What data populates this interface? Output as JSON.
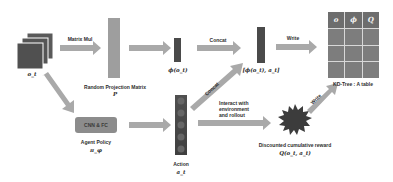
{
  "diagram": {
    "observation": {
      "label": "o_t",
      "icon": "stacked-frames-icon"
    },
    "matrix_mul": {
      "label": "Matrix Mul"
    },
    "projection": {
      "title": "Random Projection Matrix",
      "symbol": "P"
    },
    "embedding": {
      "label": "ϕ(o_t)"
    },
    "concat_top": {
      "label": "Concat"
    },
    "concat_diag": {
      "label": "Concat"
    },
    "key_vector": {
      "label": "[ϕ(o_t), a_t]"
    },
    "write_top": {
      "label": "Write"
    },
    "write_diag": {
      "label": "Write"
    },
    "kd_table": {
      "caption": "KD-Tree : A table",
      "headers": [
        "o",
        "ϕ",
        "Q"
      ],
      "rows": 3
    },
    "policy": {
      "box_label": "CNN & FC",
      "title": "Agent Policy",
      "symbol": "π_φ"
    },
    "action": {
      "title": "Action",
      "symbol": "a_t"
    },
    "interact": {
      "line1": "Interact with",
      "line2": "environment",
      "line3": "and rollout"
    },
    "reward": {
      "title": "Discounted cumulative reward",
      "symbol": "Q(o_t, a_t)"
    },
    "colors": {
      "arrow": "#a9a9a9",
      "dark_bar": "#4a4a4a",
      "light_bar": "#9e9e9e",
      "table_cell": "#7d7d7d",
      "box": "#8c8c8c",
      "starburst": "#3c3c3c"
    }
  }
}
